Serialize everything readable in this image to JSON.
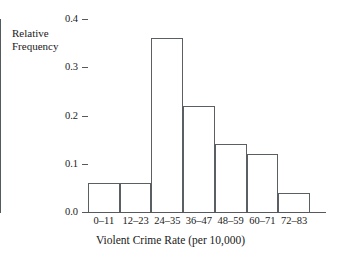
{
  "chart_data": {
    "type": "bar",
    "title": "",
    "xlabel": "Violent Crime Rate (per 10,000)",
    "ylabel": "Relative\nFrequency",
    "categories": [
      "0–11",
      "12–23",
      "24–35",
      "36–47",
      "48–59",
      "60–71",
      "72–83"
    ],
    "values": [
      0.06,
      0.06,
      0.36,
      0.22,
      0.14,
      0.12,
      0.04
    ],
    "ylim": [
      0.0,
      0.4
    ],
    "yticks": [
      "0.0",
      "0.1",
      "0.2",
      "0.3",
      "0.4"
    ],
    "ytick_values": [
      0.0,
      0.1,
      0.2,
      0.3,
      0.4
    ],
    "grid": false,
    "legend": "none",
    "bar_fill": "#ffffff",
    "bar_edge": "#5a5f63",
    "axis_color": "#555a5e",
    "background": "#ffffff"
  }
}
